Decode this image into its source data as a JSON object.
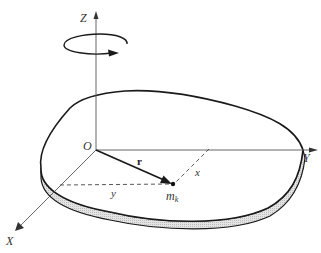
{
  "diagram": {
    "type": "rigid body rotation about Z axis (rotating disk)",
    "axes": {
      "z_label": "Z",
      "y_label": "Y",
      "x_label": "X"
    },
    "origin_label": "O",
    "vector_label": "r",
    "mass_label": "m",
    "mass_subscript": "k",
    "distance_x_label": "x",
    "distance_y_label": "y",
    "colors": {
      "line": "#1a1a1a",
      "axis": "#555555",
      "rim_fill": "#d9d9d9"
    }
  }
}
